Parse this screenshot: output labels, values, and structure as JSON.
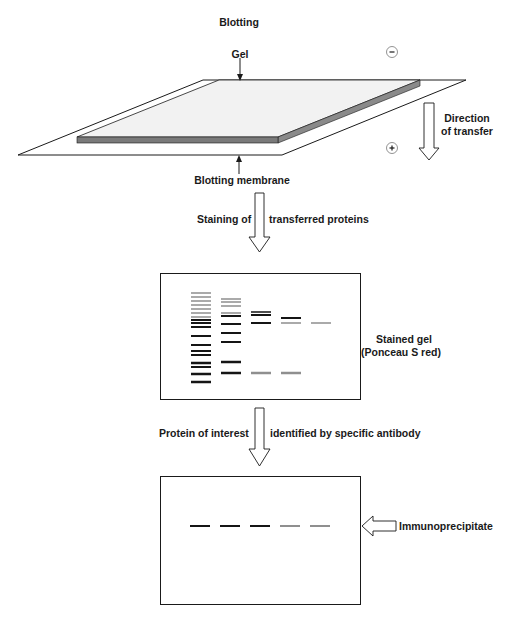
{
  "title": "Blotting",
  "labels": {
    "gel": "Gel",
    "minus": "-",
    "plus": "+",
    "direction_line1": "Direction",
    "direction_line2": "of transfer",
    "blotting_membrane": "Blotting membrane",
    "staining_left": "Staining of",
    "staining_right": "transferred proteins",
    "stained_gel_line1": "Stained gel",
    "stained_gel_line2": "(Ponceau S red)",
    "protein_left": "Protein of interest",
    "protein_right": "identified by specific antibody",
    "immunoprecipitate": "Immunoprecipitate"
  },
  "colors": {
    "line": "#1a1a1a",
    "gel_top": "#f2f2f2",
    "gel_side": "#7a7a7a",
    "band_dark": "#151515",
    "band_gray": "#8f8f8f"
  },
  "stained_gel": {
    "lanes": [
      {
        "x": 191,
        "bands": [
          {
            "y": 293,
            "c": "gray",
            "h": 1.5
          },
          {
            "y": 297,
            "c": "gray",
            "h": 1.5
          },
          {
            "y": 301,
            "c": "gray",
            "h": 1.5
          },
          {
            "y": 305,
            "c": "gray",
            "h": 1.5
          },
          {
            "y": 309,
            "c": "gray",
            "h": 1.5
          },
          {
            "y": 313,
            "c": "gray",
            "h": 1.5
          },
          {
            "y": 317,
            "c": "gray",
            "h": 1.5
          },
          {
            "y": 320,
            "c": "dark",
            "h": 2
          },
          {
            "y": 323,
            "c": "dark",
            "h": 2
          },
          {
            "y": 327,
            "c": "dark",
            "h": 2
          },
          {
            "y": 336,
            "c": "dark",
            "h": 2
          },
          {
            "y": 345,
            "c": "dark",
            "h": 2
          },
          {
            "y": 351,
            "c": "dark",
            "h": 2
          },
          {
            "y": 355,
            "c": "dark",
            "h": 2
          },
          {
            "y": 363,
            "c": "dark",
            "h": 2.5
          },
          {
            "y": 367,
            "c": "dark",
            "h": 2
          },
          {
            "y": 374,
            "c": "dark",
            "h": 2.5
          },
          {
            "y": 382,
            "c": "dark",
            "h": 2.5
          }
        ]
      },
      {
        "x": 221,
        "bands": [
          {
            "y": 299,
            "c": "gray",
            "h": 1.5
          },
          {
            "y": 302,
            "c": "gray",
            "h": 1.5
          },
          {
            "y": 306,
            "c": "gray",
            "h": 1.5
          },
          {
            "y": 313,
            "c": "gray",
            "h": 1.5
          },
          {
            "y": 316,
            "c": "dark",
            "h": 2
          },
          {
            "y": 324,
            "c": "dark",
            "h": 2
          },
          {
            "y": 333,
            "c": "dark",
            "h": 2
          },
          {
            "y": 342,
            "c": "dark",
            "h": 2
          },
          {
            "y": 362,
            "c": "dark",
            "h": 2.5
          },
          {
            "y": 373,
            "c": "dark",
            "h": 2.5
          }
        ]
      },
      {
        "x": 251,
        "bands": [
          {
            "y": 312,
            "c": "dark",
            "h": 1.5
          },
          {
            "y": 315,
            "c": "dark",
            "h": 2
          },
          {
            "y": 323,
            "c": "dark",
            "h": 2
          },
          {
            "y": 373,
            "c": "gray",
            "h": 2.5
          }
        ]
      },
      {
        "x": 281,
        "bands": [
          {
            "y": 318,
            "c": "dark",
            "h": 2
          },
          {
            "y": 323,
            "c": "gray",
            "h": 1.5
          },
          {
            "y": 373,
            "c": "gray",
            "h": 2.5
          }
        ]
      },
      {
        "x": 311,
        "bands": [
          {
            "y": 323,
            "c": "gray",
            "h": 1.5
          }
        ]
      }
    ]
  },
  "immunoblot": {
    "band_y": 526,
    "bands": [
      {
        "x": 190,
        "c": "dark"
      },
      {
        "x": 220,
        "c": "dark"
      },
      {
        "x": 250,
        "c": "dark"
      },
      {
        "x": 280,
        "c": "gray"
      },
      {
        "x": 310,
        "c": "gray"
      }
    ]
  }
}
